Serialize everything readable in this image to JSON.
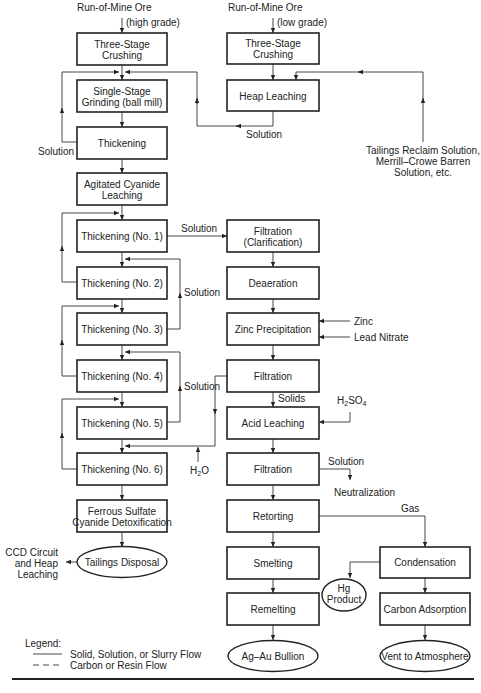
{
  "inputs": {
    "ore_high": [
      "Run-of-Mine Ore",
      "(high grade)"
    ],
    "ore_low": [
      "Run-of-Mine Ore",
      "(low grade)"
    ],
    "tailings_reclaim": [
      "Tailings Reclaim Solution,",
      "Merrill–Crowe Barren",
      "Solution, etc."
    ],
    "zinc": "Zinc",
    "lead_nitrate": "Lead Nitrate",
    "h2so4": {
      "main": "H",
      "sub1": "2",
      "mid": "SO",
      "sub2": "4"
    },
    "h2o": {
      "main": "H",
      "sub1": "2",
      "tail": "O"
    }
  },
  "flow_labels": {
    "solution_heap": "Solution",
    "solution_thickening": "Solution",
    "solution_to_filtration": "Solution",
    "solution_loop_1": "Solution",
    "solution_loop_2": "Solution",
    "solids": "Solids",
    "solution_neutral": "Solution",
    "neutralization": "Neutralization",
    "gas": "Gas",
    "ccd": [
      "CCD Circuit",
      "and Heap",
      "Leaching"
    ]
  },
  "left_column": [
    [
      "Three-Stage",
      "Crushing"
    ],
    [
      "Single-Stage",
      "Grinding (ball mill)"
    ],
    [
      "Thickening"
    ],
    [
      "Agitated Cyanide",
      "Leaching"
    ],
    [
      "Thickening (No. 1)"
    ],
    [
      "Thickening (No. 2)"
    ],
    [
      "Thickening (No. 3)"
    ],
    [
      "Thickening (No. 4)"
    ],
    [
      "Thickening (No. 5)"
    ],
    [
      "Thickening (No. 6)"
    ],
    [
      "Ferrous Sulfate",
      "Cyanide Detoxification"
    ]
  ],
  "tailings_disposal": "Tailings Disposal",
  "heap_column": [
    [
      "Three-Stage",
      "Crushing"
    ],
    [
      "Heap Leaching"
    ]
  ],
  "recovery_column": [
    [
      "Filtration",
      "(Clarification)"
    ],
    [
      "Deaeration"
    ],
    [
      "Zinc Precipitation"
    ],
    [
      "Filtration"
    ],
    [
      "Acid Leaching"
    ],
    [
      "Filtration"
    ],
    [
      "Retorting"
    ],
    [
      "Smelting"
    ],
    [
      "Remelting"
    ]
  ],
  "bullion": "Ag–Au Bullion",
  "mercury_column": {
    "condensation": "Condensation",
    "carbon_adsorption": "Carbon Adsorption",
    "hg_product": [
      "Hg",
      "Product"
    ],
    "vent": "Vent to Atmosphere"
  },
  "legend": {
    "title": "Legend:",
    "items": [
      {
        "style": "solid",
        "label": "Solid, Solution, or Slurry Flow"
      },
      {
        "style": "dashed",
        "label": "Carbon or Resin Flow"
      }
    ]
  }
}
